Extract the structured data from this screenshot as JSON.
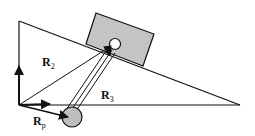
{
  "diagram": {
    "type": "vector-mechanics",
    "labels": {
      "r2": {
        "main": "R",
        "sub": "2"
      },
      "r3": {
        "main": "R",
        "sub": "3"
      },
      "rp": {
        "main": "R",
        "sub": "p"
      }
    },
    "colors": {
      "stroke": "#111111",
      "block_fill": "#c4c4c4",
      "ball_fill": "#bdbdbd",
      "background": "#ffffff"
    },
    "elements": [
      "inclined-plane-triangle",
      "sliding-block",
      "block-pivot-hole",
      "connecting-rod",
      "pivot-ball",
      "vertical-axis-arrow",
      "horizontal-axis-arrow",
      "vector-r2",
      "vector-r3",
      "vector-rp"
    ]
  }
}
